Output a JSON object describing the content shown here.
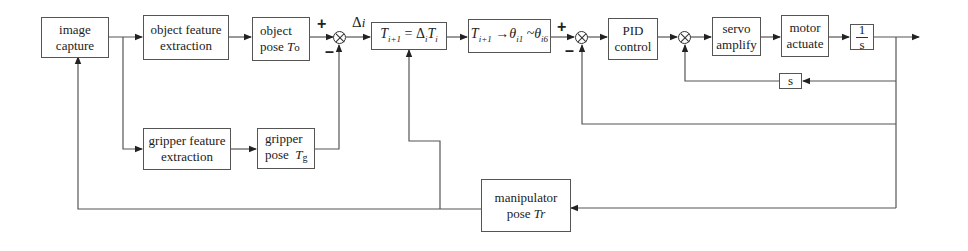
{
  "diagram": {
    "type": "control-loop block diagram",
    "blocks": {
      "image_capture": {
        "line1": "image",
        "line2": "capture"
      },
      "object_feature": {
        "line1": "object feature",
        "line2": "extraction"
      },
      "object_pose": {
        "line1": "object",
        "line2": "pose ",
        "symbol": "T",
        "sub": "o"
      },
      "gripper_feature": {
        "line1": "gripper feature",
        "line2": "extraction"
      },
      "gripper_pose": {
        "line1": "gripper",
        "line2": "pose  ",
        "symbol": "T",
        "sub": "g"
      },
      "pose_update": {
        "text_lhs": "T",
        "lhs_sub": "i+1",
        "eq": " = Δ",
        "d_sub": "i",
        "rhs": "T",
        "rhs_sub": "i"
      },
      "inverse_kin": {
        "t": "T",
        "t_sub": "i+1",
        "arrow": " →",
        "theta1": "θ",
        "theta1_sub": "i1",
        "tilde": " ~",
        "theta6": "θ",
        "theta6_sub": "i6"
      },
      "pid": {
        "line1": "PID",
        "line2": "control"
      },
      "servo": {
        "line1": "servo",
        "line2": "amplify"
      },
      "motor": {
        "line1": "motor",
        "line2": "actuate"
      },
      "integrator": {
        "num": "1",
        "den": "s"
      },
      "derivative": {
        "text": "s"
      },
      "manipulator_pose": {
        "line1": "manipulator",
        "line2": "pose ",
        "symbol": "Tr"
      }
    },
    "signals": {
      "delta_label": "Δ",
      "delta_sub": "i",
      "plus": "+",
      "minus": "–"
    }
  }
}
